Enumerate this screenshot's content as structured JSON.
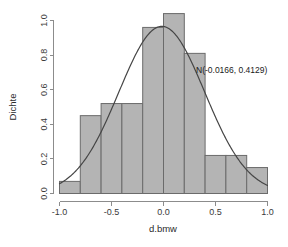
{
  "chart_data": {
    "type": "bar",
    "title": "",
    "subtitle": "",
    "xlabel": "d.bmw",
    "ylabel": "Dichte",
    "xlim": [
      -1.0,
      1.0
    ],
    "ylim": [
      0.0,
      1.05
    ],
    "grid": false,
    "legend_position": "none",
    "bin_width": 0.2,
    "bin_edges": [
      -1.0,
      -0.8,
      -0.6,
      -0.4,
      -0.2,
      0.0,
      0.2,
      0.4,
      0.6,
      0.8,
      1.0
    ],
    "categories": [
      "-1.0 to -0.8",
      "-0.8 to -0.6",
      "-0.6 to -0.4",
      "-0.4 to -0.2",
      "-0.2 to 0.0",
      "0.0 to 0.2",
      "0.2 to 0.4",
      "0.4 to 0.6",
      "0.6 to 0.8",
      "0.8 to 1.0"
    ],
    "values": [
      0.07,
      0.45,
      0.52,
      0.52,
      0.96,
      1.04,
      0.81,
      0.22,
      0.22,
      0.15
    ],
    "xticks": [
      -1.0,
      -0.5,
      0.0,
      0.5,
      1.0
    ],
    "xtick_labels": [
      "-1.0",
      "-0.5",
      "0.0",
      "0.5",
      "1.0"
    ],
    "yticks": [
      0.0,
      0.2,
      0.4,
      0.6,
      0.8,
      1.0
    ],
    "ytick_labels": [
      "0.0",
      "0.2",
      "0.4",
      "0.6",
      "0.8",
      "1.0"
    ],
    "overlay": {
      "type": "line",
      "name": "normal-density",
      "distribution": "normal",
      "mean": -0.0166,
      "sd": 0.4129,
      "peak_value": 0.966,
      "annotation": "N(-0.0166, 0.4129)"
    },
    "colors": {
      "bar_fill": "#b4b4b4",
      "bar_border": "#6b6b6b",
      "curve": "#454545",
      "axis": "#8c8c8c",
      "text": "#2b2b2b",
      "background": "#ffffff"
    }
  },
  "annotations": {
    "density_label": "N(-0.0166, 0.4129)"
  },
  "axes": {
    "x_title": "d.bmw",
    "y_title": "Dichte"
  }
}
